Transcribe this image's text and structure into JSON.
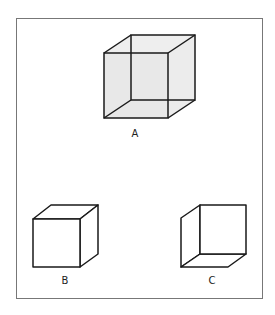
{
  "figure": {
    "frame_color": "#777777",
    "line_color": "#1a1a1a",
    "fill_color": "#ececec",
    "cubes": [
      {
        "id": "A",
        "label": "A",
        "description": "Transparent wireframe (Necker) cube, shaded faces, all edges visible"
      },
      {
        "id": "B",
        "label": "B",
        "description": "Opaque cube viewed from above-right, front face at lower-left"
      },
      {
        "id": "C",
        "label": "C",
        "description": "Opaque cube viewed from below-left, front face at upper-right"
      }
    ]
  }
}
